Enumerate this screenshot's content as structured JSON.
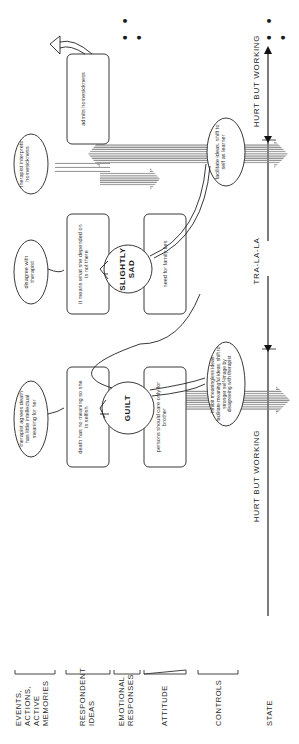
{
  "rows": [
    {
      "id": "events",
      "label": "EVENTS, ACTIONS, ACTIVE MEMORIES"
    },
    {
      "id": "respondent",
      "label": "RESPONDENT IDEAS"
    },
    {
      "id": "emotional",
      "label": "EMOTIONAL RESPONSES"
    },
    {
      "id": "attitude",
      "label": "ATTITUDE"
    },
    {
      "id": "controls",
      "label": "CONTROLS"
    },
    {
      "id": "state",
      "label": "STATE"
    }
  ],
  "events": {
    "therapist_agrees": "therapist agrees death has little intellectual meaning for her",
    "disagree": "disagree with therapist",
    "therapist_interprets": "therapist interprets homesickness",
    "admits": "admits homesickness"
  },
  "respondent_ideas": {
    "death_no_meaning": "death has no meaning so she is selfish",
    "depended_on": "it means what she depended on is not there"
  },
  "emotional_responses": {
    "guilt": "GUILT",
    "slightly_sad": "SLIGHTLY SAD"
  },
  "attitudes": {
    "care_for_brother": "persons should care only for brother",
    "family_ties": "need for family ties"
  },
  "controls": {
    "inhibit": "inhibit meaningless ideas. facilitate meaningful ideas. shift to stronger self-image by disagreeing with therapist",
    "facilitate": "facilitate ideas. shift to self as learner"
  },
  "states": {
    "first": "HURT BUT WORKING",
    "middle": "TRA-LA-LA",
    "last": "HURT BUT WORKING"
  },
  "continuation": "• • •"
}
